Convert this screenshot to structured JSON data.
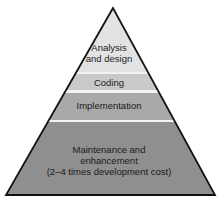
{
  "diagram": {
    "type": "pyramid",
    "layers": [
      {
        "label_lines": [
          "Analysis",
          "and design"
        ],
        "color": "#e2e2e2"
      },
      {
        "label_lines": [
          "Coding"
        ],
        "color": "#c9c9c9"
      },
      {
        "label_lines": [
          "Implementation"
        ],
        "color": "#a9a9a9"
      },
      {
        "label_lines": [
          "Maintenance and",
          "enhancement",
          "(2–4 times development cost)"
        ],
        "color": "#8f8f8f"
      }
    ],
    "separator_color": "#f2f2f2",
    "outline_color": "#111111"
  }
}
